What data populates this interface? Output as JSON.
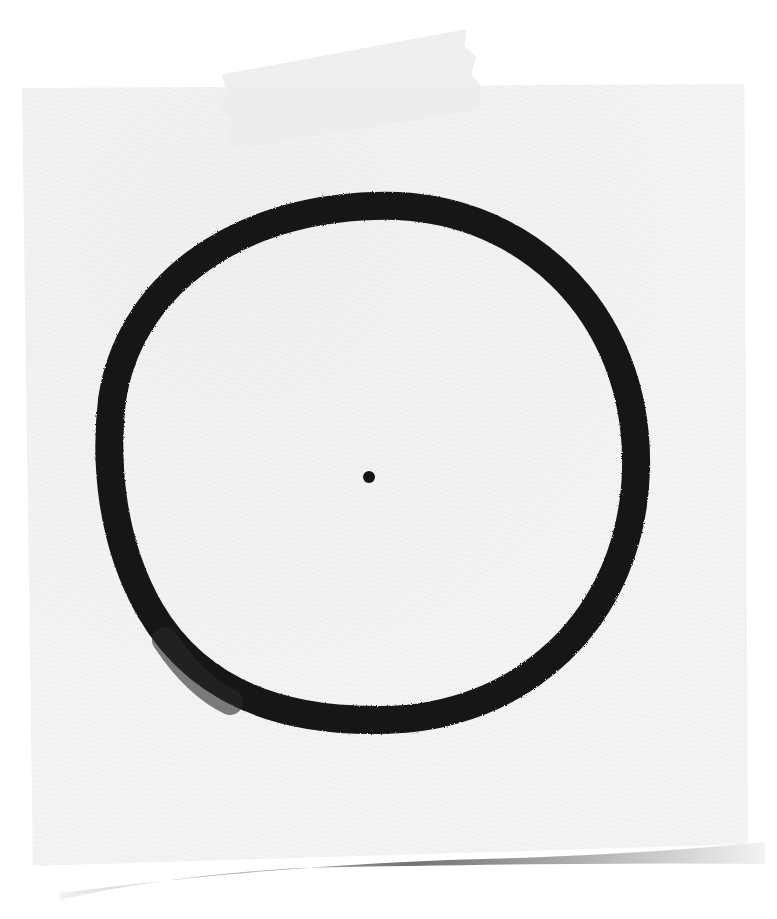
{
  "scene": {
    "description": "Hand-drawn black ink circle with a center dot on textured white paper, taped at the top",
    "paper_color": "#f4f4f3",
    "background_color": "#ffffff",
    "ink_color": "#141414",
    "tape_color": "#ececec",
    "circle": {
      "center_x": 374,
      "center_y": 462,
      "radius_x": 262,
      "radius_y": 258,
      "stroke_width": 28
    },
    "center_dot": {
      "x": 369,
      "y": 477,
      "radius": 6
    }
  }
}
